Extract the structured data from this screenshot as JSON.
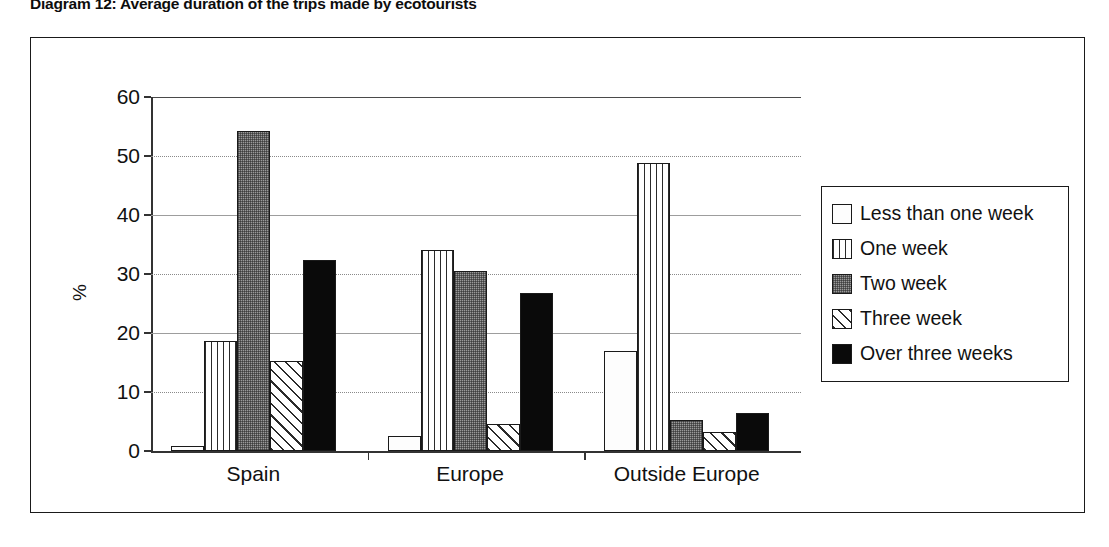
{
  "chart_data": {
    "type": "bar",
    "title": "Diagram 12: Average duration of the trips made by ecotourists",
    "xlabel": "",
    "ylabel": "%",
    "ylim": [
      0,
      60
    ],
    "ytick_step": 10,
    "yticks": [
      "0",
      "10",
      "20",
      "30",
      "40",
      "50",
      "60"
    ],
    "grid": true,
    "legend_position": "right",
    "categories": [
      "Spain",
      "Europe",
      "Outside Europe"
    ],
    "series": [
      {
        "name": "Less than one week",
        "pattern": "none",
        "values": [
          0.8,
          2.6,
          17.0
        ]
      },
      {
        "name": "One week",
        "pattern": "vert",
        "values": [
          18.7,
          34.0,
          48.8
        ]
      },
      {
        "name": "Two week",
        "pattern": "gray",
        "values": [
          54.3,
          30.5,
          5.3
        ]
      },
      {
        "name": "Three week",
        "pattern": "diag",
        "values": [
          15.2,
          4.6,
          3.2
        ]
      },
      {
        "name": "Over three weeks",
        "pattern": "solid",
        "values": [
          32.3,
          26.7,
          6.4
        ]
      }
    ]
  },
  "colors": {
    "axis": "#333333",
    "grid": "#8a8a8a",
    "frame": "#1a1a1a",
    "bar_outline": "#1a1a1a",
    "series_gray": "#9a9a9a",
    "series_black": "#0a0a0a",
    "background": "#ffffff"
  }
}
